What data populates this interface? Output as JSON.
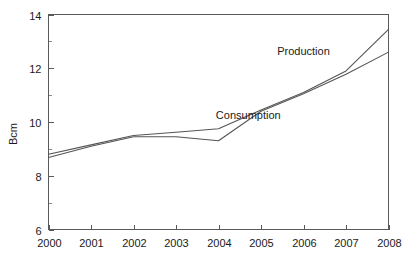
{
  "chart_data": {
    "type": "line",
    "title": "",
    "subtitle": "",
    "xlabel": "",
    "ylabel": "Bcm",
    "x": [
      2000,
      2001,
      2002,
      2003,
      2004,
      2005,
      2006,
      2007,
      2008
    ],
    "categories": [
      "2000",
      "2001",
      "2002",
      "2003",
      "2004",
      "2005",
      "2006",
      "2007",
      "2008"
    ],
    "xlim": [
      2000,
      2008
    ],
    "ylim": [
      6,
      14
    ],
    "y_major_ticks": [
      6,
      8,
      10,
      12,
      14
    ],
    "y_major_tick_labels": [
      "6",
      "8",
      "10",
      "12",
      "14"
    ],
    "y_minor_ticks": [
      7,
      9,
      11,
      13
    ],
    "grid": false,
    "legend": "inline-annotations",
    "series": [
      {
        "name": "Production",
        "color": "#555555",
        "values": [
          8.8,
          9.15,
          9.5,
          9.62,
          9.75,
          10.45,
          11.1,
          11.9,
          13.45
        ],
        "annotation": {
          "text": "Production",
          "x_value": 2006.0,
          "y_value": 12.5
        }
      },
      {
        "name": "Consumption",
        "color": "#555555",
        "values": [
          8.68,
          9.1,
          9.45,
          9.45,
          9.3,
          10.4,
          11.05,
          11.78,
          12.6
        ],
        "annotation": {
          "text": "Consumption",
          "x_value": 2004.7,
          "y_value": 10.1
        }
      }
    ],
    "annotations": [
      {
        "text": "Production",
        "x_value": 2006.0,
        "y_value": 12.5
      },
      {
        "text": "Consumption",
        "x_value": 2004.7,
        "y_value": 10.1
      }
    ]
  },
  "axis": {
    "y_title": "Bcm"
  }
}
